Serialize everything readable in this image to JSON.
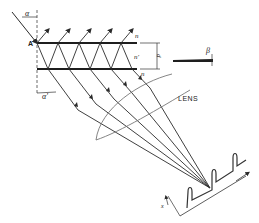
{
  "diagram": {
    "type": "optics-interference-plate",
    "labels": {
      "point_a": "A",
      "angle_incidence": "α",
      "angle_refraction": "α'",
      "index_outer_top": "n",
      "index_plate": "n'",
      "index_outer_bottom": "n",
      "thickness": "d",
      "wedge_angle": "β",
      "lens": "LENS",
      "position_axis": "x"
    },
    "reflected_beam_count": 5,
    "transmitted_beam_count": 5,
    "fringe_peak_count": 3,
    "colors": {
      "line": "#2a2a2a",
      "lens": "#777777",
      "background": "#ffffff"
    }
  }
}
